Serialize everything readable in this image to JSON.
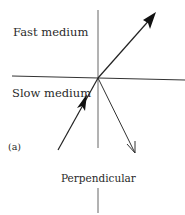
{
  "figure": {
    "labels": {
      "fast_medium": "Fast medium",
      "slow_medium": "Slow medium",
      "panel": "(a)",
      "perpendicular": "Perpendicular"
    },
    "colors": {
      "line": "#222222",
      "boundary": "#333333",
      "normal": "#555555",
      "text": "#2a2a2a"
    },
    "geometry": {
      "interface_line": {
        "x1": 12,
        "y1": 76,
        "x2": 185,
        "y2": 80
      },
      "normal_upper": {
        "x1": 98,
        "y1": 10,
        "x2": 98,
        "y2": 148
      },
      "normal_lower": {
        "x1": 98,
        "y1": 188,
        "x2": 98,
        "y2": 213
      },
      "incident_ray": {
        "x1": 58,
        "y1": 150,
        "x2": 98,
        "y2": 78
      },
      "refracted_ray": {
        "x1": 98,
        "y1": 78,
        "x2": 155,
        "y2": 13
      },
      "reflected_ray": {
        "x1": 98,
        "y1": 78,
        "x2": 135,
        "y2": 153
      }
    }
  }
}
